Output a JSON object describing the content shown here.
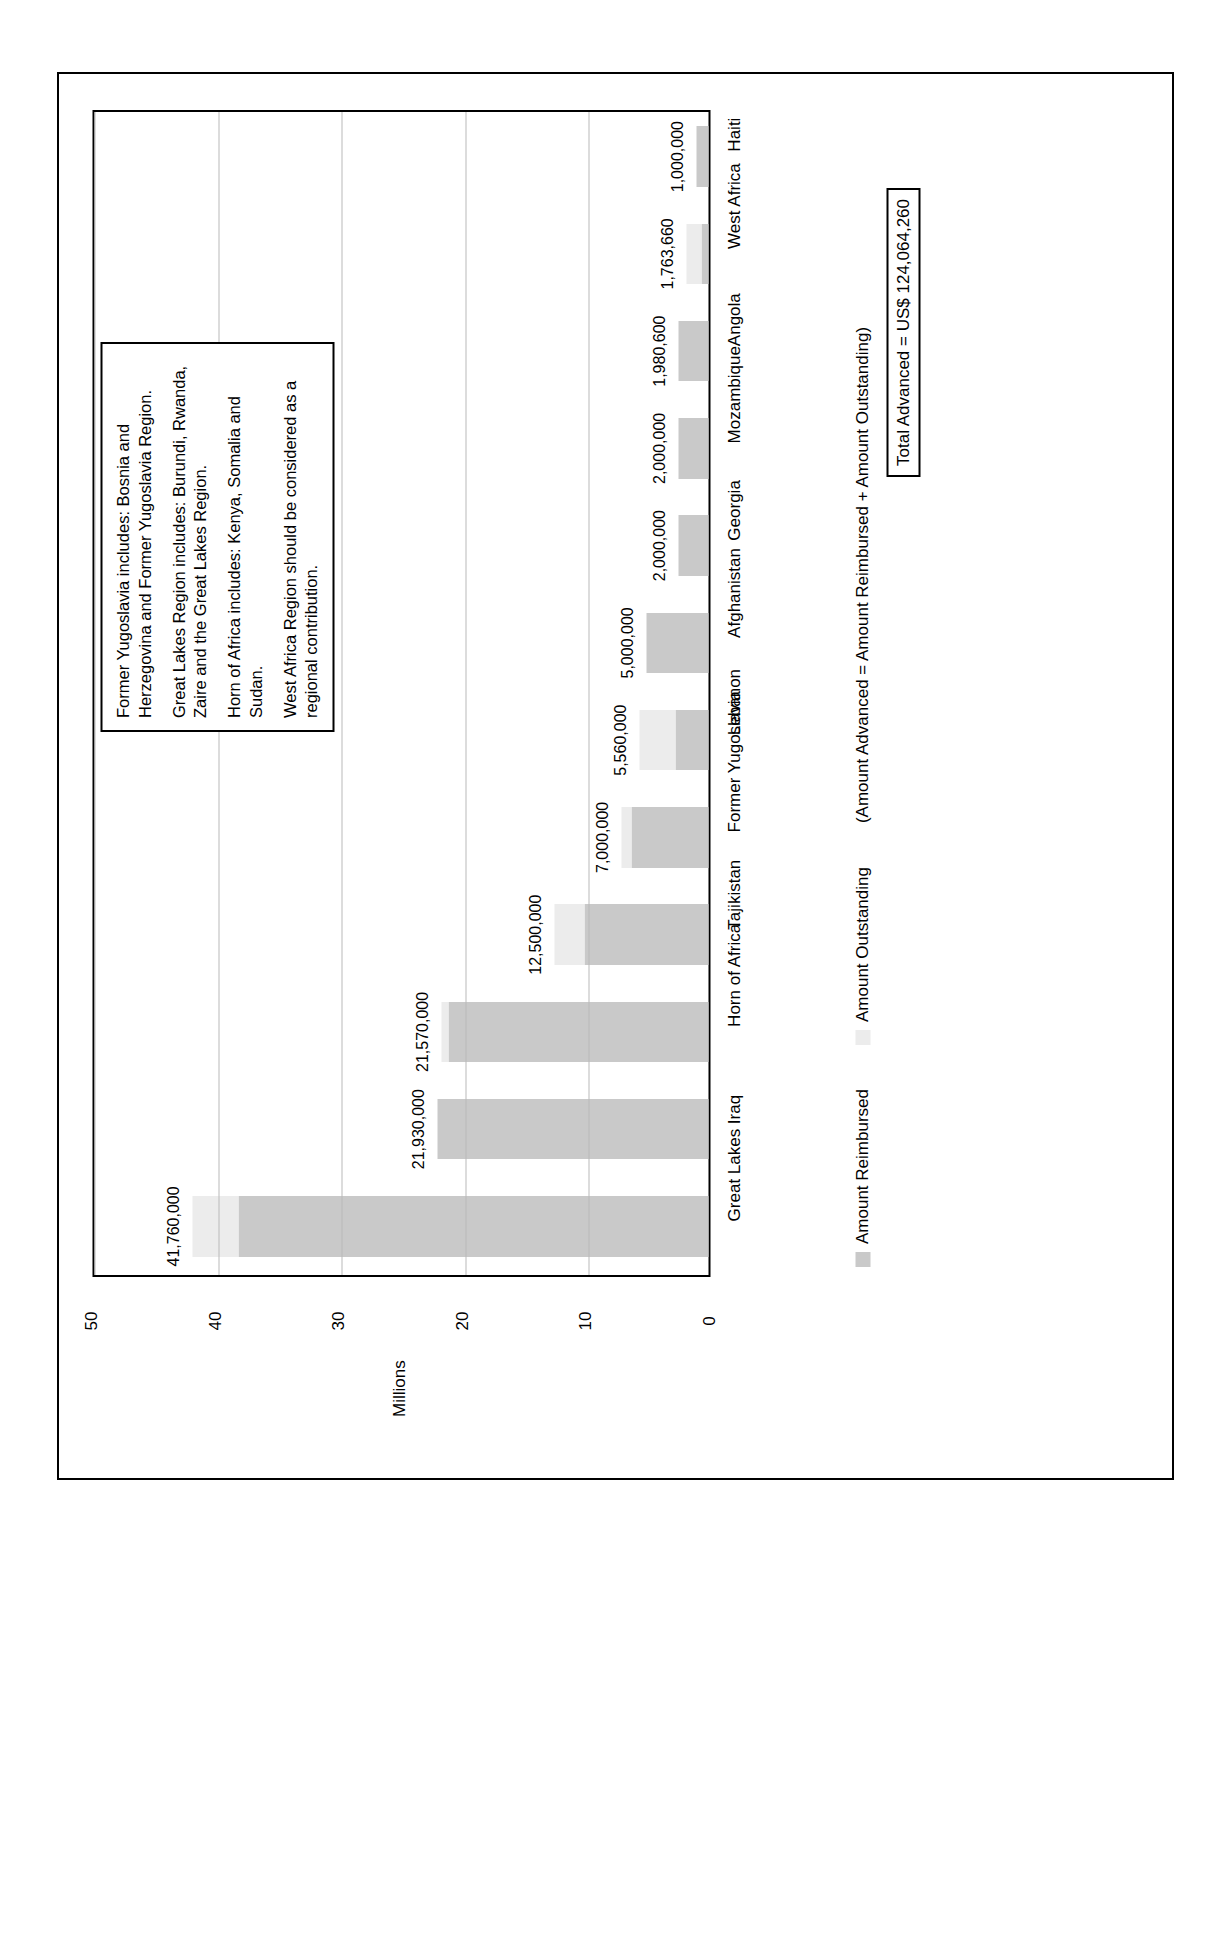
{
  "chart_data": {
    "type": "bar",
    "title": "",
    "subtitle": "",
    "xlabel": "",
    "ylabel": "Millions",
    "ylim": [
      0,
      50
    ],
    "ytick_labels": [
      "0",
      "10",
      "20",
      "30",
      "40",
      "50"
    ],
    "ytick_values": [
      0,
      10,
      20,
      30,
      40,
      50
    ],
    "grid": true,
    "stacked": true,
    "legend_position": "right",
    "categories": [
      "Great Lakes",
      "Iraq",
      "Horn of Africa",
      "Tajikistan",
      "Former Yugoslavia",
      "Lebanon",
      "Afghanistan",
      "Georgia",
      "Mozambique",
      "Angola",
      "West Africa",
      "Haiti"
    ],
    "series": [
      {
        "name": "Amount Reimbursed",
        "color": "#c9c9c9",
        "values": [
          38000000,
          21930000,
          21000000,
          10000000,
          6250000,
          2700000,
          5000000,
          2400000,
          2400000,
          2400000,
          600000,
          1000000
        ]
      },
      {
        "name": "Amount Outstanding",
        "color": "#ececec",
        "values": [
          3760000,
          0,
          570000,
          2500000,
          750000,
          2860000,
          0,
          0,
          0,
          0,
          1163660,
          0
        ]
      }
    ],
    "data_labels": [
      "41,760,000",
      "21,930,000",
      "21,570,000",
      "12,500,000",
      "7,000,000",
      "5,560,000",
      "5,000,000",
      "2,000,000",
      "2,000,000",
      "1,980,600",
      "1,763,660",
      "1,000,000"
    ],
    "totals": [
      41760000,
      21930000,
      21570000,
      12500000,
      7000000,
      5560000,
      5000000,
      2000000,
      2000000,
      1980600,
      1763660,
      1000000
    ]
  },
  "legend": {
    "items": [
      {
        "label": "Amount Reimbursed",
        "color": "#c9c9c9"
      },
      {
        "label": "Amount Outstanding",
        "color": "#ececec"
      }
    ],
    "note": "(Amount Advanced = Amount Reimbursed + Amount Outstanding)",
    "total": "Total Advanced = US$ 124,064,260"
  },
  "annotation": {
    "lines": [
      "Former Yugoslavia includes: Bosnia and Herzegovina and Former Yugoslavia Region.",
      "Great Lakes Region includes: Burundi, Rwanda, Zaire and the Great Lakes Region.",
      "Horn of Africa includes: Kenya, Somalia and Sudan.",
      "West Africa Region should be considered as a regional contribution."
    ]
  },
  "axis": {
    "y_title": "Millions"
  }
}
